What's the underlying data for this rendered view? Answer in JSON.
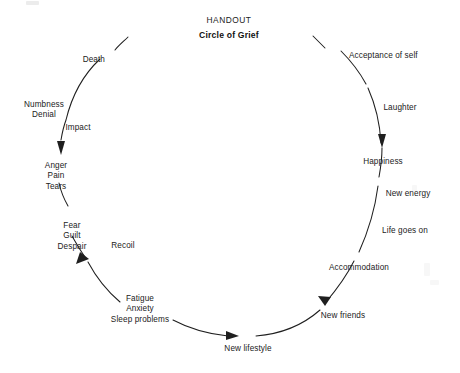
{
  "document": {
    "handout_label": "HANDOUT",
    "title": "Circle of Grief"
  },
  "diagram": {
    "type": "cycle-diagram",
    "direction": "clockwise",
    "line_color": "#1f1f1f",
    "text_color": "#222222",
    "background": "#ffffff",
    "stages": [
      {
        "id": "death",
        "label": "Death",
        "x": 105,
        "y": 55,
        "align": "right"
      },
      {
        "id": "numbness-denial",
        "label": "Numbness\nDenial",
        "x": 44,
        "y": 100,
        "align": "center"
      },
      {
        "id": "impact",
        "label": "Impact",
        "x": 78,
        "y": 123,
        "align": "center"
      },
      {
        "id": "anger-pain-tears",
        "label": "Anger\nPain\nTears",
        "x": 56,
        "y": 161,
        "align": "center"
      },
      {
        "id": "fear-guilt-despair",
        "label": "Fear\nGuilt\nDespair",
        "x": 72,
        "y": 221,
        "align": "center"
      },
      {
        "id": "recoil",
        "label": "Recoil",
        "x": 123,
        "y": 241,
        "align": "center"
      },
      {
        "id": "fatigue-anxiety-sleep",
        "label": "Fatigue\nAnxiety\nSleep problems",
        "x": 140,
        "y": 294,
        "align": "center"
      },
      {
        "id": "new-lifestyle",
        "label": "New lifestyle",
        "x": 248,
        "y": 344,
        "align": "center"
      },
      {
        "id": "new-friends",
        "label": "New friends",
        "x": 343,
        "y": 311,
        "align": "center"
      },
      {
        "id": "accommodation",
        "label": "Accommodation",
        "x": 359,
        "y": 263,
        "align": "center"
      },
      {
        "id": "life-goes-on",
        "label": "Life goes on",
        "x": 405,
        "y": 226,
        "align": "center"
      },
      {
        "id": "new-energy",
        "label": "New energy",
        "x": 408,
        "y": 189,
        "align": "center"
      },
      {
        "id": "happiness",
        "label": "Happiness",
        "x": 383,
        "y": 157,
        "align": "center"
      },
      {
        "id": "laughter",
        "label": "Laughter",
        "x": 400,
        "y": 103,
        "align": "center"
      },
      {
        "id": "acceptance-of-self",
        "label": "Acceptance of self",
        "x": 349,
        "y": 51,
        "align": "left"
      }
    ],
    "arrows": [
      {
        "id": "arrow-to-anger",
        "points_to": "Anger / Pain / Tears"
      },
      {
        "id": "arrow-to-fatigue",
        "points_to": "Fatigue / Anxiety / Sleep problems"
      },
      {
        "id": "arrow-to-new-lifestyle",
        "points_to": "New lifestyle"
      },
      {
        "id": "arrow-to-new-friends",
        "points_to": "New friends"
      },
      {
        "id": "arrow-to-happiness",
        "points_to": "Happiness"
      }
    ]
  }
}
